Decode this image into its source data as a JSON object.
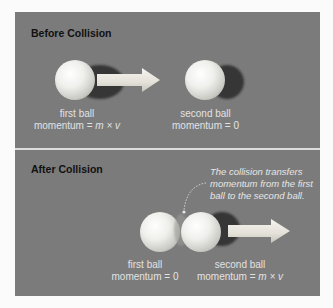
{
  "before": {
    "title": "Before Collision",
    "first_ball": {
      "name": "first ball",
      "momentum_prefix": "momentum = ",
      "momentum_value": "m × v"
    },
    "second_ball": {
      "name": "second ball",
      "momentum_prefix": "momentum = ",
      "momentum_value": "0"
    }
  },
  "after": {
    "title": "After Collision",
    "annotation": [
      "The collision transfers",
      "momentum from the first",
      "ball to the second ball."
    ],
    "first_ball": {
      "name": "first ball",
      "momentum_prefix": "momentum = ",
      "momentum_value": "0"
    },
    "second_ball": {
      "name": "second ball",
      "momentum_prefix": "momentum = ",
      "momentum_value": "m × v"
    }
  },
  "colors": {
    "panel": "#7b7b7b",
    "divider": "#dcdcdc",
    "title": "#111111",
    "label": "#e2e2e2",
    "ball": "#eeeeea",
    "arrow": "#e8e6e0"
  }
}
